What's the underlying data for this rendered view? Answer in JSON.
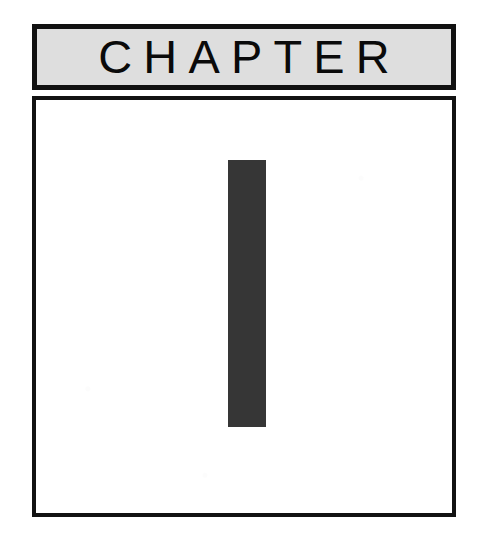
{
  "page": {
    "kind": "book-chapter-opening-page",
    "background_color": "#ffffff"
  },
  "header_band": {
    "label": "CHAPTER",
    "background_color": "#dedede",
    "border_color": "#111111",
    "text_color": "#0a0a0a"
  },
  "content_frame": {
    "border_color": "#121212",
    "background_color": "#ffffff"
  },
  "chapter_number": {
    "value": "1",
    "color": "#363636"
  }
}
